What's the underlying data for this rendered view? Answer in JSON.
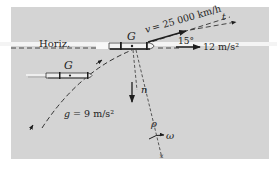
{
  "figure": {
    "horizon_label": "Horiz.",
    "cg_label_current": "G",
    "cg_label_previous": "G",
    "velocity_label": "v = 25 000 km/h",
    "angle_label": "15°",
    "tangent_label": "t",
    "normal_label": "n",
    "thrust_accel_label": "12 m/s²",
    "gravity_label": "g = 9 m/s²",
    "radius_label": "ρ",
    "omega_label": "ω"
  },
  "colors": {
    "panel": "#d4d4d4",
    "ink": "#1e1e1e",
    "horizon_band": "#f4f4f4"
  }
}
